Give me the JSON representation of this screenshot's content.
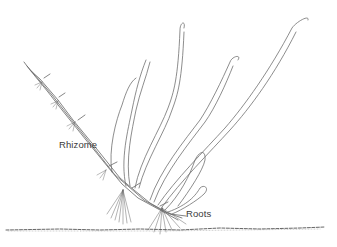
{
  "illustration": {
    "subject": "plant with rhizome and roots",
    "style": "pen-and-ink line drawing",
    "stroke_color": "#555555",
    "background": "#ffffff"
  },
  "labels": {
    "rhizome": "Rhizome",
    "roots": "Roots"
  }
}
